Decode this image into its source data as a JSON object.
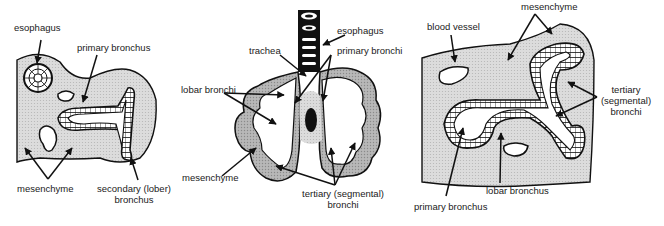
{
  "colors": {
    "ink": "#111111",
    "mesenchyme_fill": "#d9d9d9",
    "mesenchyme_dark": "#a8a8a8",
    "lumen": "#ffffff"
  },
  "panels": [
    {
      "id": "panel-left",
      "labels": {
        "esophagus": "esophagus",
        "primary_bronchus": "primary bronchus",
        "mesenchyme": "mesenchyme",
        "secondary_line1": "secondary (lober)",
        "secondary_line2": "bronchus"
      }
    },
    {
      "id": "panel-center",
      "labels": {
        "esophagus": "esophagus",
        "trachea": "trachea",
        "primary_bronchi": "primary bronchi",
        "lobar_bronchi": "lobar bronchi",
        "mesenchyme": "mesenchyme",
        "tertiary_line1": "tertiary (segmental)",
        "tertiary_line2": "bronchi"
      }
    },
    {
      "id": "panel-right",
      "labels": {
        "blood_vessel": "blood vessel",
        "mesenchyme": "mesenchyme",
        "tertiary_line1": "tertiary",
        "tertiary_line2": "(segmental)",
        "tertiary_line3": "bronchi",
        "lobar_bronchus": "lobar bronchus",
        "primary_bronchus": "primary bronchus"
      }
    }
  ]
}
